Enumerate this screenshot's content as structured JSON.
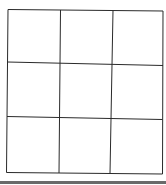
{
  "diagram": {
    "type": "grid",
    "rows": 3,
    "cols": 3,
    "cells": [
      [
        "",
        "",
        ""
      ],
      [
        "",
        "",
        ""
      ],
      [
        "",
        "",
        ""
      ]
    ],
    "line_color": "#2a2a2a",
    "background": "#ffffff",
    "footer_bar_color": "#6a6a6a"
  }
}
